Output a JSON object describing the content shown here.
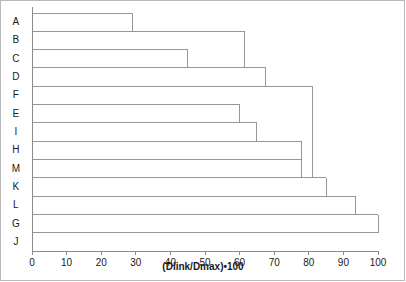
{
  "chart_data": {
    "type": "line",
    "subtype": "dendrogram",
    "title": "",
    "xlabel": "(Dlink/Dmax)•100",
    "ylabel": "",
    "xlim": [
      0,
      100
    ],
    "xticks": [
      0,
      10,
      20,
      30,
      40,
      50,
      60,
      70,
      80,
      90,
      100
    ],
    "grid": false,
    "legend": null,
    "leaf_labels": [
      "A",
      "B",
      "C",
      "D",
      "F",
      "E",
      "I",
      "H",
      "M",
      "K",
      "L",
      "G",
      "J"
    ],
    "leaf_order_top_to_bottom": [
      "A",
      "B",
      "C",
      "D",
      "F",
      "E",
      "I",
      "H",
      "M",
      "K",
      "L",
      "G",
      "J"
    ],
    "axis_color": "#8c8c8c",
    "line_color": "#8c8c8c",
    "background": "#ffffff",
    "merges": [
      {
        "label": "A-B",
        "members": [
          "A",
          "B"
        ],
        "distance": 29
      },
      {
        "label": "C-D",
        "members": [
          "C",
          "D"
        ],
        "distance": 45
      },
      {
        "label": "E-I",
        "members": [
          "E",
          "I"
        ],
        "distance": 60
      },
      {
        "label": "I-H",
        "members": [
          "I",
          "H"
        ],
        "distance": 65
      },
      {
        "label": "AB-CD",
        "members": [
          "A-B",
          "C-D"
        ],
        "distance": 61.5
      },
      {
        "label": "ABCD-D",
        "members": [
          "AB-CD",
          "D"
        ],
        "distance": 67.5
      },
      {
        "label": "H-M",
        "members": [
          "H",
          "M"
        ],
        "distance": 78
      },
      {
        "label": "F-cluster",
        "members": [
          "F",
          "HM"
        ],
        "distance": 81
      },
      {
        "label": "K-join",
        "members": [
          "K",
          "FHM"
        ],
        "distance": 85
      },
      {
        "label": "L-join",
        "members": [
          "L",
          "K"
        ],
        "distance": 93.5
      },
      {
        "label": "G-join",
        "members": [
          "G",
          "L"
        ],
        "distance": 100
      }
    ],
    "series": [
      {
        "name": "A",
        "link_distance": 29
      },
      {
        "name": "B",
        "link_distance": 61.5
      },
      {
        "name": "C",
        "link_distance": 45
      },
      {
        "name": "D",
        "link_distance": 67.5
      },
      {
        "name": "F",
        "link_distance": 81
      },
      {
        "name": "E",
        "link_distance": 60
      },
      {
        "name": "I",
        "link_distance": 65
      },
      {
        "name": "H",
        "link_distance": 78
      },
      {
        "name": "M",
        "link_distance": 78
      },
      {
        "name": "K",
        "link_distance": 85
      },
      {
        "name": "L",
        "link_distance": 93.5
      },
      {
        "name": "G",
        "link_distance": 100
      },
      {
        "name": "J",
        "link_distance": 100
      }
    ]
  },
  "axis": {
    "x_title": "(Dlink/Dmax)•100",
    "ticks": [
      "0",
      "10",
      "20",
      "30",
      "40",
      "50",
      "60",
      "70",
      "80",
      "90",
      "100"
    ]
  },
  "leaves": [
    {
      "label": "A"
    },
    {
      "label": "B"
    },
    {
      "label": "C"
    },
    {
      "label": "D"
    },
    {
      "label": "F"
    },
    {
      "label": "E"
    },
    {
      "label": "I"
    },
    {
      "label": "H"
    },
    {
      "label": "M"
    },
    {
      "label": "K"
    },
    {
      "label": "L"
    },
    {
      "label": "G"
    },
    {
      "label": "J"
    }
  ]
}
